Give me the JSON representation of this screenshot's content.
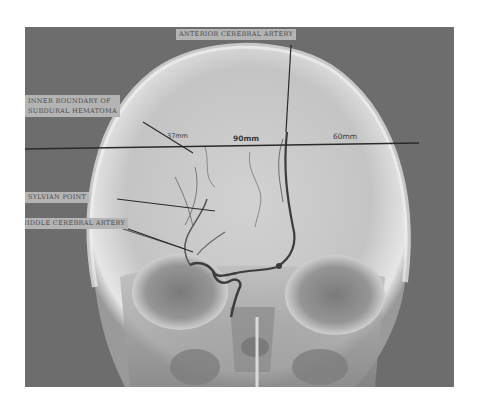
{
  "figure": {
    "labels": {
      "anterior_cerebral_artery": "ANTERIOR CEREBRAL ARTERY",
      "inner_boundary_line1": "INNER BOUNDARY OF",
      "inner_boundary_line2": "SUBDURAL HEMATOMA",
      "sylvian_point": "SYLVIAN POINT",
      "middle_cerebral_artery": "MIDDLE CEREBRAL ARTERY"
    },
    "measurements": {
      "left": "37mm",
      "center": "90mm",
      "right": "60mm"
    },
    "colors": {
      "background": "#6d6d6d",
      "skull": "#d9d9d9",
      "label_bg": "#b4b4b4",
      "annotation_line": "#2a2a2a"
    }
  }
}
